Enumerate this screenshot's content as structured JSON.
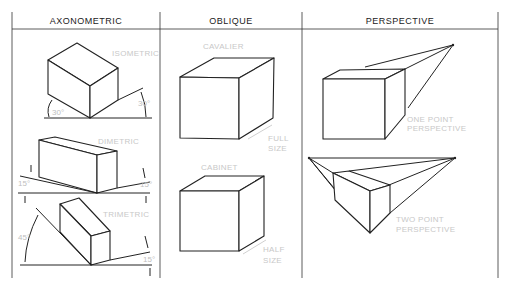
{
  "columns": [
    {
      "header": "AXONOMETRIC",
      "examples": [
        {
          "label": "ISOMETRIC",
          "angles": [
            "30°",
            "30°"
          ]
        },
        {
          "label": "DIMETRIC",
          "angles": [
            "15°",
            "15°"
          ]
        },
        {
          "label": "TRIMETRIC",
          "angles": [
            "45°",
            "15°"
          ]
        }
      ]
    },
    {
      "header": "OBLIQUE",
      "examples": [
        {
          "label": "CAVALIER",
          "depth_note": [
            "FULL",
            "SIZE"
          ]
        },
        {
          "label": "CABINET",
          "depth_note": [
            "HALF",
            "SIZE"
          ]
        }
      ]
    },
    {
      "header": "PERSPECTIVE",
      "examples": [
        {
          "label": [
            "ONE POINT",
            "PERSPECTIVE"
          ]
        },
        {
          "label": [
            "TWO POINT",
            "PERSPECTIVE"
          ]
        }
      ]
    }
  ]
}
